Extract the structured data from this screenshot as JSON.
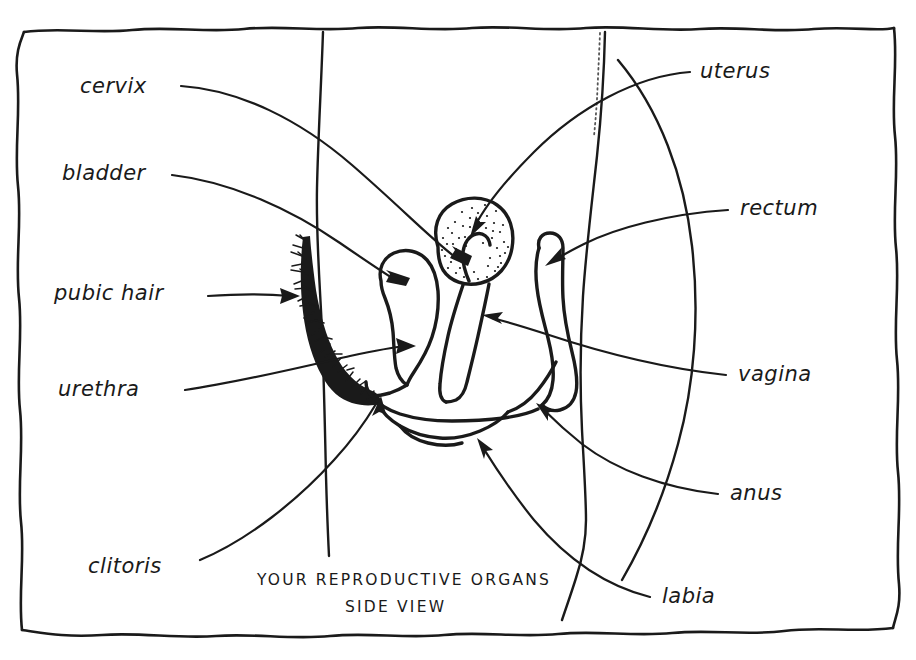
{
  "figure": {
    "title": "YOUR REPRODUCTIVE ORGANS",
    "subtitle": "SIDE VIEW",
    "style": "hand-drawn pen-and-ink anatomical diagram",
    "ink_color": "#1a1a1a",
    "background_color": "#ffffff"
  },
  "labels": {
    "cervix": "cervix",
    "bladder": "bladder",
    "pubic_hair": "pubic hair",
    "urethra": "urethra",
    "clitoris": "clitoris",
    "uterus": "uterus",
    "rectum": "rectum",
    "vagina": "vagina",
    "anus": "anus",
    "labia": "labia"
  },
  "label_list": [
    {
      "name": "cervix",
      "text": "cervix",
      "side": "left",
      "x": 80,
      "y": 93
    },
    {
      "name": "bladder",
      "text": "bladder",
      "side": "left",
      "x": 62,
      "y": 180
    },
    {
      "name": "pubic-hair",
      "text": "pubic hair",
      "side": "left",
      "x": 54,
      "y": 300
    },
    {
      "name": "urethra",
      "text": "urethra",
      "side": "left",
      "x": 58,
      "y": 396
    },
    {
      "name": "clitoris",
      "text": "clitoris",
      "side": "left",
      "x": 88,
      "y": 573
    },
    {
      "name": "uterus",
      "text": "uterus",
      "side": "right",
      "x": 700,
      "y": 78
    },
    {
      "name": "rectum",
      "text": "rectum",
      "side": "right",
      "x": 740,
      "y": 215
    },
    {
      "name": "vagina",
      "text": "vagina",
      "side": "right",
      "x": 738,
      "y": 381
    },
    {
      "name": "anus",
      "text": "anus",
      "side": "right",
      "x": 730,
      "y": 500
    },
    {
      "name": "labia",
      "text": "labia",
      "side": "right",
      "x": 662,
      "y": 603
    }
  ],
  "organs": [
    "uterus",
    "cervix",
    "bladder",
    "urethra",
    "vagina",
    "rectum",
    "anus",
    "labia",
    "clitoris",
    "pubic hair"
  ]
}
